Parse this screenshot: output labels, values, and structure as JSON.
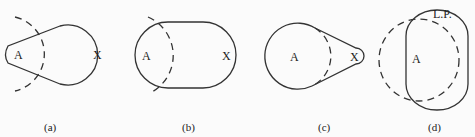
{
  "panels": [
    {
      "id": "a",
      "caption": "(a)",
      "labels": {
        "left": "A",
        "right": "X"
      }
    },
    {
      "id": "b",
      "caption": "(b)",
      "labels": {
        "left": "A",
        "right": "X"
      }
    },
    {
      "id": "c",
      "caption": "(c)",
      "labels": {
        "left": "A",
        "right": "X"
      }
    },
    {
      "id": "d",
      "caption": "(d)",
      "labels": {
        "top": "L.P.",
        "left": "A"
      }
    }
  ],
  "colors": {
    "stroke": "#333333",
    "background": "#fbfbfb"
  }
}
